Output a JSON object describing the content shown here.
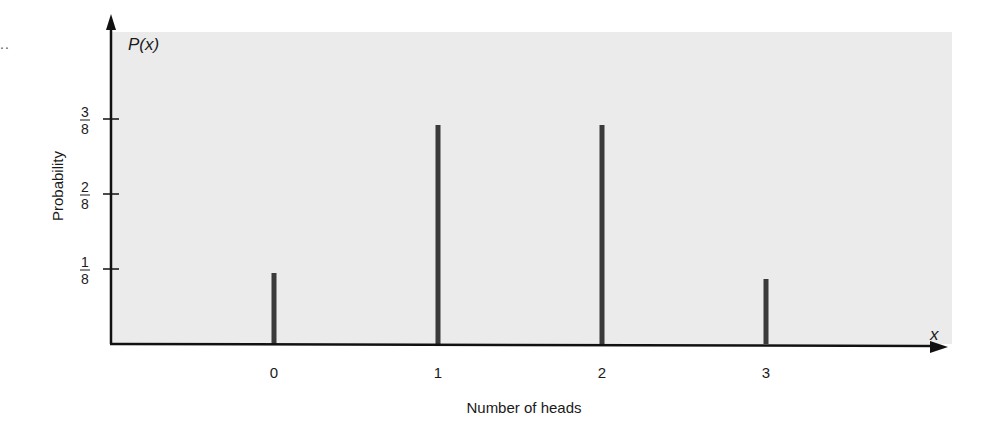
{
  "chart_data": {
    "type": "bar",
    "style": "stem",
    "title": "",
    "xlabel": "Number of heads",
    "ylabel": "Probability",
    "x_axis_symbol": "x",
    "y_axis_symbol": "P(x)",
    "categories": [
      "0",
      "1",
      "2",
      "3"
    ],
    "x": [
      0,
      1,
      2,
      3
    ],
    "values": [
      0.125,
      0.375,
      0.375,
      0.125
    ],
    "values_fraction": [
      "1/8",
      "3/8",
      "3/8",
      "1/8"
    ],
    "y_ticks": [
      {
        "value": 0.125,
        "num": "1",
        "den": "8"
      },
      {
        "value": 0.25,
        "num": "2",
        "den": "8"
      },
      {
        "value": 0.375,
        "num": "3",
        "den": "8"
      }
    ],
    "ylim": [
      0,
      0.5
    ],
    "xlim": [
      -1,
      4
    ],
    "grid": false,
    "legend": null
  },
  "colors": {
    "panel_background": "#ebebeb",
    "axis": "#111111",
    "bar": "#3a3a3a",
    "text": "#1a1a1a"
  },
  "page": {
    "leader_dots": ".."
  }
}
